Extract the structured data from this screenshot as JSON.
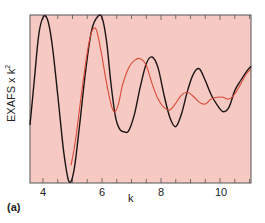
{
  "chart_data": {
    "type": "line",
    "title": "",
    "panel_label": "(a)",
    "xlabel": "k",
    "ylabel": "EXAFS x k",
    "ylabel_superscript": "2",
    "xlim": [
      3.56,
      11.05
    ],
    "ylim": [
      -1.0,
      1.0
    ],
    "xticks_major": [
      4,
      6,
      8,
      10
    ],
    "xticks_minor_step": 0.5,
    "yticks": [],
    "grid": false,
    "legend": null,
    "background_color": "#f6c9c3",
    "frame_color": "#555555",
    "series": [
      {
        "name": "black",
        "color": "#1a1414",
        "x": [
          3.56,
          3.7,
          3.85,
          4.0,
          4.15,
          4.3,
          4.5,
          4.7,
          4.88,
          5.05,
          5.25,
          5.45,
          5.65,
          5.85,
          6.0,
          6.15,
          6.3,
          6.45,
          6.6,
          6.75,
          6.9,
          7.1,
          7.3,
          7.5,
          7.7,
          7.9,
          8.1,
          8.3,
          8.5,
          8.7,
          8.9,
          9.1,
          9.3,
          9.5,
          9.7,
          9.9,
          10.1,
          10.3,
          10.5,
          10.7,
          10.9,
          11.05
        ],
        "y": [
          -0.31,
          0.2,
          0.75,
          0.97,
          0.95,
          0.68,
          0.05,
          -0.62,
          -0.98,
          -0.85,
          -0.28,
          0.35,
          0.82,
          0.98,
          0.97,
          0.7,
          0.2,
          -0.2,
          -0.36,
          -0.39,
          -0.38,
          -0.18,
          0.15,
          0.42,
          0.5,
          0.37,
          0.05,
          -0.22,
          -0.33,
          -0.17,
          0.1,
          0.3,
          0.36,
          0.22,
          0.05,
          -0.07,
          -0.15,
          -0.1,
          0.1,
          0.22,
          0.33,
          0.39
        ]
      },
      {
        "name": "red",
        "color": "#d94a35",
        "x": [
          4.95,
          5.1,
          5.3,
          5.5,
          5.65,
          5.8,
          5.95,
          6.1,
          6.25,
          6.4,
          6.55,
          6.7,
          6.9,
          7.1,
          7.3,
          7.5,
          7.7,
          7.9,
          8.1,
          8.3,
          8.5,
          8.7,
          8.9,
          9.1,
          9.3,
          9.5,
          9.7,
          9.9,
          10.1,
          10.3,
          10.5,
          10.7,
          10.9,
          11.05
        ],
        "y": [
          -0.79,
          -0.5,
          0.05,
          0.55,
          0.8,
          0.83,
          0.6,
          0.3,
          0.02,
          -0.15,
          -0.07,
          0.17,
          0.37,
          0.46,
          0.48,
          0.4,
          0.18,
          0.0,
          -0.1,
          -0.13,
          -0.05,
          0.05,
          0.08,
          0.03,
          -0.04,
          -0.06,
          0.0,
          0.02,
          0.02,
          0.0,
          0.06,
          0.18,
          0.3,
          0.36
        ]
      }
    ]
  },
  "labels": {
    "x_axis": "k",
    "y_axis_main": "EXAFS x k",
    "y_axis_sup": "2",
    "panel": "(a)",
    "ticks": [
      "4",
      "6",
      "8",
      "10"
    ]
  }
}
